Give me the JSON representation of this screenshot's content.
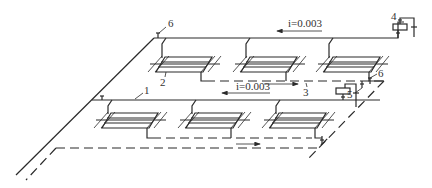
{
  "diagram": {
    "labels": {
      "l1": "1",
      "l2": "2",
      "l3": "3",
      "l4": "4",
      "l5": "5",
      "l6a": "6",
      "l6b": "6"
    },
    "slopes": {
      "upper": "i=0.003",
      "lower": "i=0.003"
    },
    "legend": {
      "solid_line": "supply pipe",
      "dashed_line": "return pipe"
    },
    "colors": {
      "line": "#2a2a2a",
      "background": "#ffffff"
    }
  }
}
